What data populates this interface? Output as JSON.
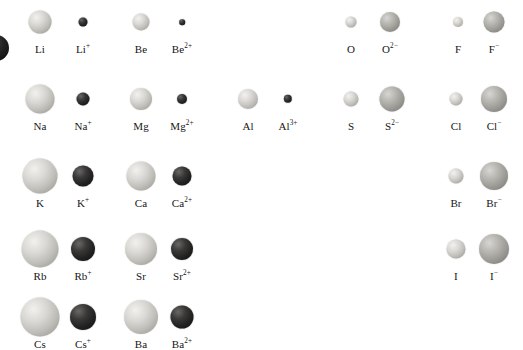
{
  "figure": {
    "colors": {
      "neutral_atom": "#c9c7c2",
      "cation": "#1a1a1a",
      "anion": "#a09e99",
      "label_text": "#161616",
      "background": "#ffffff"
    },
    "edge_artifact": {
      "name": "clipped-sphere-left-edge",
      "cx": -4,
      "cy": 48,
      "r": 13
    },
    "rows": [
      {
        "period": 2,
        "y_sphere": 22,
        "y_label": 44,
        "species": [
          {
            "label": "Li",
            "element": "Li",
            "charge": "",
            "kind": "neutral",
            "cx": 40,
            "r": 11.5
          },
          {
            "label": "Li",
            "element": "Li",
            "charge": "+",
            "kind": "cation",
            "cx": 83,
            "r": 4.5
          },
          {
            "label": "Be",
            "element": "Be",
            "charge": "",
            "kind": "neutral",
            "cx": 141,
            "r": 8.5
          },
          {
            "label": "Be",
            "element": "Be",
            "charge": "2+",
            "kind": "cation",
            "cx": 182,
            "r": 2.8
          },
          {
            "label": "O",
            "element": "O",
            "charge": "",
            "kind": "neutral",
            "cx": 351,
            "r": 5.5
          },
          {
            "label": "O",
            "element": "O",
            "charge": "2-",
            "kind": "anion",
            "cx": 390,
            "r": 10.0
          },
          {
            "label": "F",
            "element": "F",
            "charge": "",
            "kind": "neutral",
            "cx": 458,
            "r": 5.0
          },
          {
            "label": "F",
            "element": "F",
            "charge": "-",
            "kind": "anion",
            "cx": 494,
            "r": 10.5
          }
        ]
      },
      {
        "period": 3,
        "y_sphere": 99,
        "y_label": 121,
        "species": [
          {
            "label": "Na",
            "element": "Na",
            "charge": "",
            "kind": "neutral",
            "cx": 40,
            "r": 14.5
          },
          {
            "label": "Na",
            "element": "Na",
            "charge": "+",
            "kind": "cation",
            "cx": 83,
            "r": 6.5
          },
          {
            "label": "Mg",
            "element": "Mg",
            "charge": "",
            "kind": "neutral",
            "cx": 141,
            "r": 11.0
          },
          {
            "label": "Mg",
            "element": "Mg",
            "charge": "2+",
            "kind": "cation",
            "cx": 182,
            "r": 5.0
          },
          {
            "label": "Al",
            "element": "Al",
            "charge": "",
            "kind": "neutral",
            "cx": 248,
            "r": 10.0
          },
          {
            "label": "Al",
            "element": "Al",
            "charge": "3+",
            "kind": "cation",
            "cx": 288,
            "r": 4.2
          },
          {
            "label": "S",
            "element": "S",
            "charge": "",
            "kind": "neutral",
            "cx": 351,
            "r": 7.5
          },
          {
            "label": "S",
            "element": "S",
            "charge": "2-",
            "kind": "anion",
            "cx": 392,
            "r": 12.5
          },
          {
            "label": "Cl",
            "element": "Cl",
            "charge": "",
            "kind": "neutral",
            "cx": 456,
            "r": 6.5
          },
          {
            "label": "Cl",
            "element": "Cl",
            "charge": "-",
            "kind": "anion",
            "cx": 494,
            "r": 13.0
          }
        ]
      },
      {
        "period": 4,
        "y_sphere": 176,
        "y_label": 198,
        "species": [
          {
            "label": "K",
            "element": "K",
            "charge": "",
            "kind": "neutral",
            "cx": 40,
            "r": 17.5
          },
          {
            "label": "K",
            "element": "K",
            "charge": "+",
            "kind": "cation",
            "cx": 83,
            "r": 10.5
          },
          {
            "label": "Ca",
            "element": "Ca",
            "charge": "",
            "kind": "neutral",
            "cx": 141,
            "r": 14.5
          },
          {
            "label": "Ca",
            "element": "Ca",
            "charge": "2+",
            "kind": "cation",
            "cx": 182,
            "r": 9.5
          },
          {
            "label": "Br",
            "element": "Br",
            "charge": "",
            "kind": "neutral",
            "cx": 456,
            "r": 7.5
          },
          {
            "label": "Br",
            "element": "Br",
            "charge": "-",
            "kind": "anion",
            "cx": 494,
            "r": 14.0
          }
        ]
      },
      {
        "period": 5,
        "y_sphere": 249,
        "y_label": 271,
        "species": [
          {
            "label": "Rb",
            "element": "Rb",
            "charge": "",
            "kind": "neutral",
            "cx": 40,
            "r": 18.5
          },
          {
            "label": "Rb",
            "element": "Rb",
            "charge": "+",
            "kind": "cation",
            "cx": 83,
            "r": 12.0
          },
          {
            "label": "Sr",
            "element": "Sr",
            "charge": "",
            "kind": "neutral",
            "cx": 141,
            "r": 16.0
          },
          {
            "label": "Sr",
            "element": "Sr",
            "charge": "2+",
            "kind": "cation",
            "cx": 182,
            "r": 11.0
          },
          {
            "label": "I",
            "element": "I",
            "charge": "",
            "kind": "neutral",
            "cx": 456,
            "r": 9.5
          },
          {
            "label": "I",
            "element": "I",
            "charge": "-",
            "kind": "anion",
            "cx": 494,
            "r": 15.0
          }
        ]
      },
      {
        "period": 6,
        "y_sphere": 317,
        "y_label": 339,
        "species": [
          {
            "label": "Cs",
            "element": "Cs",
            "charge": "",
            "kind": "neutral",
            "cx": 40,
            "r": 19.5
          },
          {
            "label": "Cs",
            "element": "Cs",
            "charge": "+",
            "kind": "cation",
            "cx": 83,
            "r": 13.0
          },
          {
            "label": "Ba",
            "element": "Ba",
            "charge": "",
            "kind": "neutral",
            "cx": 141,
            "r": 17.0
          },
          {
            "label": "Ba",
            "element": "Ba",
            "charge": "2+",
            "kind": "cation",
            "cx": 182,
            "r": 11.5
          }
        ]
      }
    ]
  }
}
